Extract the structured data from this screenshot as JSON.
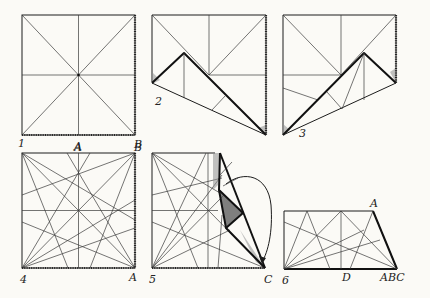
{
  "figure": {
    "steps": [
      {
        "number": "1",
        "corner_labels": [
          "A",
          "B"
        ]
      },
      {
        "number": "2",
        "corner_labels": []
      },
      {
        "number": "3",
        "corner_labels": []
      },
      {
        "number": "4",
        "corner_labels": [
          "A",
          "B",
          "A"
        ]
      },
      {
        "number": "5",
        "corner_labels": [
          "C"
        ]
      },
      {
        "number": "6",
        "corner_labels": [
          "A",
          "D",
          "ABC"
        ]
      }
    ]
  },
  "colors": {
    "paper": "#fbfaf6",
    "ink": "#1c1c1c",
    "shading": "#8f8f8f"
  }
}
